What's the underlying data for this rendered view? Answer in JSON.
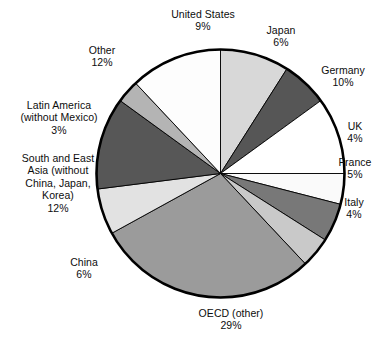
{
  "chart_data": {
    "type": "pie",
    "title": "",
    "subtitle": "",
    "xlabel": "",
    "ylabel": "",
    "legend": "none",
    "grid": false,
    "labels_show_percent": true,
    "total_percent": 100,
    "start_angle_deg": 0,
    "direction": "clockwise",
    "categories": [
      "United States",
      "Japan",
      "Germany",
      "UK",
      "France",
      "Italy",
      "OECD (other)",
      "China",
      "South and East Asia (without China, Japan, Korea)",
      "Latin America (without Mexico)",
      "Other"
    ],
    "values": [
      9,
      6,
      10,
      4,
      5,
      4,
      29,
      6,
      12,
      3,
      12
    ],
    "slices": [
      {
        "name": "United States",
        "value": 9,
        "percent_label": "9%",
        "color": "#d8d8d8"
      },
      {
        "name": "Japan",
        "value": 6,
        "percent_label": "6%",
        "color": "#565656"
      },
      {
        "name": "Germany",
        "value": 10,
        "percent_label": "10%",
        "color": "#ffffff"
      },
      {
        "name": "UK",
        "value": 4,
        "percent_label": "4%",
        "color": "#fafafa"
      },
      {
        "name": "France",
        "value": 5,
        "percent_label": "5%",
        "color": "#787878"
      },
      {
        "name": "Italy",
        "value": 4,
        "percent_label": "4%",
        "color": "#c9c9c9"
      },
      {
        "name": "OECD (other)",
        "value": 29,
        "percent_label": "29%",
        "color": "#9b9b9b"
      },
      {
        "name": "China",
        "value": 6,
        "percent_label": "6%",
        "color": "#e2e2e2"
      },
      {
        "name": "South and East Asia",
        "value": 12,
        "percent_label": "12%",
        "color": "#575757"
      },
      {
        "name": "Latin America",
        "value": 3,
        "percent_label": "3%",
        "color": "#b4b4b4"
      },
      {
        "name": "Other",
        "value": 12,
        "percent_label": "12%",
        "color": "#fdfdfd"
      }
    ]
  },
  "labels": {
    "united_states": {
      "name": "United States",
      "percent": "9%"
    },
    "japan": {
      "name": "Japan",
      "percent": "6%"
    },
    "germany": {
      "name": "Germany",
      "percent": "10%"
    },
    "uk": {
      "name": "UK",
      "percent": "4%"
    },
    "france": {
      "name": "France",
      "percent": "5%"
    },
    "italy": {
      "name": "Italy",
      "percent": "4%"
    },
    "oecd": {
      "name": "OECD (other)",
      "percent": "29%"
    },
    "china": {
      "name": "China",
      "percent": "6%"
    },
    "south_east_asia": {
      "line1": "South and East",
      "line2": "Asia (without",
      "line3": "China, Japan,",
      "line4": "Korea)",
      "percent": "12%"
    },
    "latin_america": {
      "line1": "Latin America",
      "line2": "(without Mexico)",
      "percent": "3%"
    },
    "other": {
      "name": "Other",
      "percent": "12%"
    }
  },
  "style": {
    "outline_color": "#000000",
    "background": "#ffffff",
    "text_color": "#0d0d0d"
  }
}
